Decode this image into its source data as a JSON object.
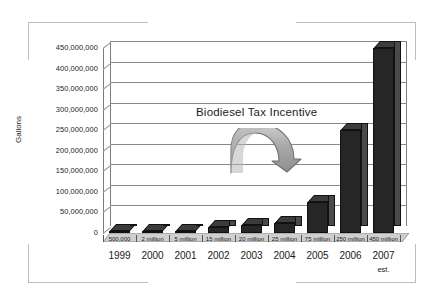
{
  "chart_data": {
    "type": "bar",
    "title": "",
    "xlabel": "",
    "ylabel": "Gallons",
    "categories": [
      "1999",
      "2000",
      "2001",
      "2002",
      "2003",
      "2004",
      "2005",
      "2006",
      "2007"
    ],
    "category_sublabels": [
      "",
      "",
      "",
      "",
      "",
      "",
      "",
      "",
      "est."
    ],
    "values": [
      500000,
      2000000,
      5000000,
      15000000,
      20000000,
      25000000,
      75000000,
      250000000,
      450000000
    ],
    "data_labels": [
      "500,000",
      "2 million",
      "5 million",
      "15 million",
      "20 million",
      "25 million",
      "75 million",
      "250 million",
      "450 million"
    ],
    "ylim": [
      0,
      450000000
    ],
    "ytick_values": [
      0,
      50000000,
      100000000,
      150000000,
      200000000,
      250000000,
      300000000,
      350000000,
      400000000,
      450000000
    ],
    "ytick_labels": [
      "0",
      "50,000,000",
      "100,000,000",
      "150,000,000",
      "200,000,000",
      "250,000,000",
      "300,000,000",
      "350,000,000",
      "400,000,000",
      "450,000,000"
    ],
    "grid": true,
    "legend": "none",
    "style": "3d-column",
    "bar_color": "#262626",
    "bar_side_color": "#4a4a4a",
    "grid_color": "#8a8a8a",
    "annotations": [
      {
        "name": "biodiesel-tax-incentive",
        "text": "Biodiesel Tax Incentive",
        "arrow": "curved-arch-arrow-right",
        "arrow_color": "#a8a8a8"
      }
    ]
  },
  "figure": {
    "background": "#ffffff",
    "frame_color": "#bcbcbc"
  }
}
